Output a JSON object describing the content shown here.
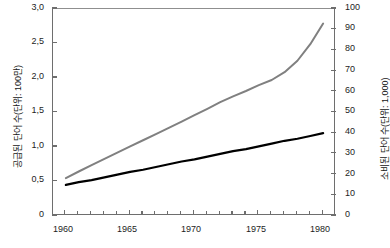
{
  "chart_data": {
    "type": "line",
    "title": "",
    "xlabel": "",
    "ylabel": "공급된 단어 수(단위: 100만)",
    "y2label": "소비된 단어 수(단위: 1,000)",
    "grid": false,
    "legend_position": "none",
    "xlim": [
      1959,
      1981
    ],
    "xticks_major": [
      1960,
      1965,
      1970,
      1975,
      1980
    ],
    "xtick_labels": [
      "1960",
      "1965",
      "1970",
      "1975",
      "1980"
    ],
    "xticks_minor": [
      1961,
      1962,
      1963,
      1964,
      1966,
      1967,
      1968,
      1969,
      1971,
      1972,
      1973,
      1974,
      1976,
      1977,
      1978,
      1979
    ],
    "ylim": [
      0,
      3.0
    ],
    "yticks": [
      0,
      0.5,
      1.0,
      1.5,
      2.0,
      2.5,
      3.0
    ],
    "ytick_labels": [
      "0",
      "0,5",
      "1,0",
      "1,5",
      "2,0",
      "2,5",
      "3,0"
    ],
    "y2lim": [
      0,
      100
    ],
    "y2ticks": [
      0,
      10,
      20,
      30,
      40,
      50,
      60,
      70,
      80,
      90,
      100
    ],
    "y2tick_labels": [
      "0",
      "10",
      "20",
      "30",
      "40",
      "50",
      "60",
      "70",
      "80",
      "90",
      "100"
    ],
    "x": [
      1960,
      1961,
      1962,
      1963,
      1964,
      1965,
      1966,
      1967,
      1968,
      1969,
      1970,
      1971,
      1972,
      1973,
      1974,
      1975,
      1976,
      1977,
      1978,
      1979,
      1980
    ],
    "series": [
      {
        "name": "소비된 단어 수(단위: 1,000)",
        "axis": "right",
        "color": "#808080",
        "width": 2.0,
        "values": [
          18.3,
          21.5,
          24.6,
          27.6,
          30.6,
          33.6,
          36.6,
          39.6,
          42.6,
          45.6,
          48.7,
          51.8,
          55.0,
          57.8,
          60.4,
          63.2,
          65.7,
          69.5,
          75.0,
          83.0,
          93.0
        ]
      },
      {
        "name": "공급된 단어 수(단위: 100만)",
        "axis": "left",
        "color": "#000000",
        "width": 2.2,
        "values": [
          0.45,
          0.49,
          0.52,
          0.56,
          0.6,
          0.64,
          0.67,
          0.71,
          0.75,
          0.79,
          0.82,
          0.86,
          0.9,
          0.94,
          0.97,
          1.01,
          1.05,
          1.09,
          1.12,
          1.16,
          1.2
        ]
      }
    ]
  }
}
